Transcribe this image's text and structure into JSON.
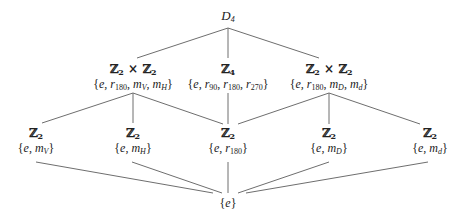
{
  "diagram": {
    "stroke_color": "#6e6e6e",
    "text_color": "#222222",
    "nodes": {
      "d4": {
        "label": "D",
        "sub": "4",
        "x": 228,
        "y": 8
      },
      "klein_v": {
        "group": "Z2 × Z2",
        "set": "{e, r180, mV, mH}",
        "x": 133,
        "y": 62
      },
      "z4": {
        "group": "Z4",
        "set": "{e, r90, r180, r270}",
        "x": 228,
        "y": 62
      },
      "klein_d": {
        "group": "Z2 × Z2",
        "set": "{e, r180, mD, md}",
        "x": 329,
        "y": 62
      },
      "z2_mv": {
        "group": "Z2",
        "set": "{e, mV}",
        "x": 36,
        "y": 126
      },
      "z2_mh": {
        "group": "Z2",
        "set": "{e, mH}",
        "x": 133,
        "y": 126
      },
      "z2_r180": {
        "group": "Z2",
        "set": "{e, r180}",
        "x": 228,
        "y": 126
      },
      "z2_md_cap": {
        "group": "Z2",
        "set": "{e, mD}",
        "x": 329,
        "y": 126
      },
      "z2_md": {
        "group": "Z2",
        "set": "{e, md}",
        "x": 430,
        "y": 126
      },
      "trivial": {
        "set": "{e}",
        "x": 228,
        "y": 196
      }
    },
    "edges": [
      {
        "from": "d4",
        "to": "klein_v",
        "x1": 228,
        "y1": 28,
        "x2": 137,
        "y2": 58
      },
      {
        "from": "d4",
        "to": "z4",
        "x1": 228,
        "y1": 28,
        "x2": 228,
        "y2": 58
      },
      {
        "from": "d4",
        "to": "klein_d",
        "x1": 228,
        "y1": 28,
        "x2": 319,
        "y2": 58
      },
      {
        "from": "klein_v",
        "to": "z2_mv",
        "x1": 133,
        "y1": 93,
        "x2": 42,
        "y2": 123
      },
      {
        "from": "klein_v",
        "to": "z2_mh",
        "x1": 133,
        "y1": 93,
        "x2": 133,
        "y2": 123
      },
      {
        "from": "klein_v",
        "to": "z2_r180",
        "x1": 133,
        "y1": 93,
        "x2": 223,
        "y2": 124
      },
      {
        "from": "z4",
        "to": "z2_r180",
        "x1": 228,
        "y1": 93,
        "x2": 228,
        "y2": 124
      },
      {
        "from": "klein_d",
        "to": "z2_r180",
        "x1": 329,
        "y1": 93,
        "x2": 238,
        "y2": 124
      },
      {
        "from": "klein_d",
        "to": "z2_md_cap",
        "x1": 329,
        "y1": 93,
        "x2": 329,
        "y2": 124
      },
      {
        "from": "klein_d",
        "to": "z2_md",
        "x1": 329,
        "y1": 93,
        "x2": 420,
        "y2": 124
      },
      {
        "from": "z2_mv",
        "to": "trivial",
        "x1": 36,
        "y1": 162,
        "x2": 213,
        "y2": 193
      },
      {
        "from": "z2_mh",
        "to": "trivial",
        "x1": 132,
        "y1": 162,
        "x2": 222,
        "y2": 193
      },
      {
        "from": "z2_r180",
        "to": "trivial",
        "x1": 228,
        "y1": 162,
        "x2": 228,
        "y2": 193
      },
      {
        "from": "z2_md_cap",
        "to": "trivial",
        "x1": 329,
        "y1": 162,
        "x2": 238,
        "y2": 193
      },
      {
        "from": "z2_md",
        "to": "trivial",
        "x1": 428,
        "y1": 162,
        "x2": 246,
        "y2": 193
      }
    ]
  }
}
